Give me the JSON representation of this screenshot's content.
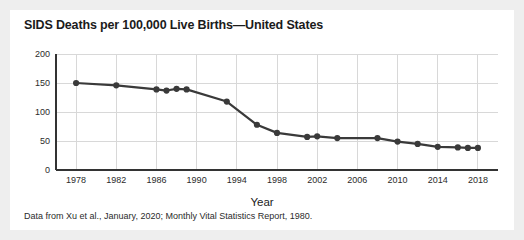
{
  "figure": {
    "title": "SIDS Deaths per 100,000 Live Births—United States",
    "caption": "Data from Xu et al., January, 2020; Monthly Vital Statistics Report, 1980.",
    "background_color": "#eeeeee",
    "card_color": "#ffffff",
    "series_color": "#3a3a3a",
    "grid_color": "#d8d8d8",
    "axis_color": "#333333"
  },
  "chart_data": {
    "type": "line",
    "title": "SIDS Deaths per 100,000 Live Births—United States",
    "xlabel": "Year",
    "ylabel": "",
    "xlim": [
      1976,
      2020
    ],
    "ylim": [
      0,
      200
    ],
    "grid": true,
    "legend": false,
    "xticks": [
      1978,
      1982,
      1986,
      1990,
      1994,
      1998,
      2002,
      2006,
      2010,
      2014,
      2018
    ],
    "yticks": [
      0,
      50,
      100,
      150,
      200
    ],
    "x": [
      1978,
      1982,
      1986,
      1987,
      1988,
      1989,
      1993,
      1996,
      1998,
      2001,
      2002,
      2004,
      2008,
      2010,
      2012,
      2014,
      2016,
      2017,
      2018
    ],
    "values": [
      150,
      146,
      139,
      137,
      140,
      139,
      118,
      78,
      64,
      57,
      58,
      55,
      55,
      49,
      45,
      40,
      39,
      38,
      38
    ],
    "series": [
      {
        "name": "SIDS deaths per 100,000 live births",
        "values": [
          150,
          146,
          139,
          137,
          140,
          139,
          118,
          78,
          64,
          57,
          58,
          55,
          55,
          49,
          45,
          40,
          39,
          38,
          38
        ]
      }
    ]
  }
}
